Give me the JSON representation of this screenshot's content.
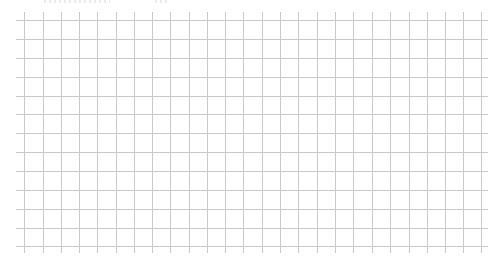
{
  "grid": {
    "line_color": "#c9c9c9",
    "background": "#ffffff",
    "vertical_lines_x": [
      24,
      43,
      61,
      79,
      97,
      116,
      134,
      152,
      170,
      189,
      207,
      225,
      243,
      262,
      280,
      298,
      317,
      335,
      353,
      372,
      390,
      409,
      427,
      445,
      463,
      481
    ],
    "horizontal_lines_y": [
      20,
      39,
      58,
      77,
      96,
      114,
      133,
      152,
      171,
      190,
      209,
      228,
      246
    ],
    "vertical_extent": [
      12,
      253
    ],
    "horizontal_extent": [
      16,
      488
    ],
    "columns": 25,
    "rows": 12
  }
}
